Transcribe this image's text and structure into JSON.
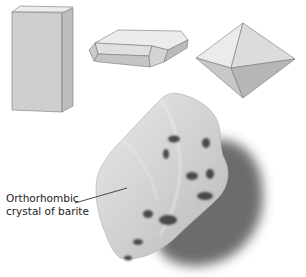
{
  "figure": {
    "crystal_models": [
      {
        "id": "prism",
        "shape": "rectangular-prism-icon"
      },
      {
        "id": "tabular",
        "shape": "tabular-crystal-icon"
      },
      {
        "id": "dipyramid",
        "shape": "dipyramid-icon"
      }
    ],
    "specimen": {
      "caption_line1": "Orthorhombic",
      "caption_line2": "crystal of barite"
    }
  }
}
